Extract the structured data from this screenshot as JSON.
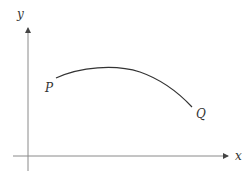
{
  "diagram": {
    "axes": {
      "x_label": "x",
      "y_label": "y",
      "axis_color": "#8a8a8a"
    },
    "curve": {
      "start_label": "P",
      "end_label": "Q",
      "color": "#333333",
      "description": "Smooth concave-down arc rising from P to a maximum, then falling to Q"
    }
  }
}
